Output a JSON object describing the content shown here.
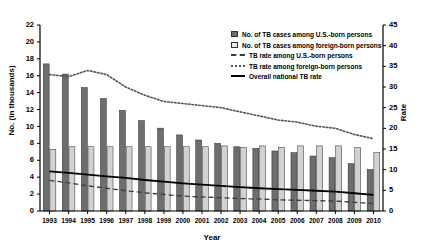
{
  "chart_data": {
    "type": "bar",
    "title": "",
    "xlabel": "Year",
    "ylabel": "No. (in thousands)",
    "ylabel_secondary": "Rate",
    "ylim": [
      0,
      22
    ],
    "ylim_secondary": [
      0,
      45
    ],
    "ytick_values": [
      0,
      2,
      4,
      6,
      8,
      10,
      12,
      14,
      16,
      18,
      20,
      22
    ],
    "ytick_values_secondary": [
      0,
      5,
      10,
      15,
      20,
      25,
      30,
      35,
      40,
      45
    ],
    "grid": false,
    "legend_position": "top-right",
    "categories": [
      "1993",
      "1994",
      "1995",
      "1996",
      "1997",
      "1998",
      "1999",
      "2000",
      "2001",
      "2002",
      "2003",
      "2004",
      "2005",
      "2006",
      "2007",
      "2008",
      "2009",
      "2010"
    ],
    "series": [
      {
        "name": "No. of TB cases among U.S.-born persons",
        "type": "bar",
        "axis": "left",
        "color": "#6e6e6e",
        "values": [
          17.4,
          16.2,
          14.6,
          13.3,
          11.9,
          10.7,
          9.8,
          9.0,
          8.4,
          8.0,
          7.6,
          7.4,
          7.1,
          6.9,
          6.5,
          6.3,
          5.6,
          4.9
        ]
      },
      {
        "name": "No. of TB cases among foreign-born persons",
        "type": "bar",
        "axis": "left",
        "color": "#d2d2d2",
        "values": [
          7.3,
          7.6,
          7.6,
          7.6,
          7.6,
          7.6,
          7.6,
          7.6,
          7.6,
          7.7,
          7.5,
          7.7,
          7.5,
          7.7,
          7.7,
          7.7,
          7.5,
          6.9
        ]
      },
      {
        "name": "TB rate among U.S.-born persons",
        "type": "line",
        "axis": "right",
        "style": "dashed",
        "color": "#3c3c3c",
        "values": [
          7.4,
          6.8,
          6.1,
          5.5,
          4.9,
          4.4,
          4.0,
          3.6,
          3.4,
          3.2,
          3.0,
          2.9,
          2.7,
          2.6,
          2.5,
          2.4,
          2.1,
          1.8
        ]
      },
      {
        "name": "TB rate among foreign-born persons",
        "type": "line",
        "axis": "right",
        "style": "dotted",
        "color": "#555555",
        "values": [
          33.0,
          32.5,
          34.0,
          33.0,
          30.0,
          28.0,
          26.5,
          26.0,
          25.5,
          25.0,
          24.0,
          23.0,
          22.0,
          21.5,
          20.5,
          20.0,
          18.5,
          17.5
        ]
      },
      {
        "name": "Overall national TB rate",
        "type": "line",
        "axis": "right",
        "style": "solid",
        "color": "#000000",
        "values": [
          9.6,
          9.2,
          8.8,
          8.4,
          8.0,
          7.5,
          7.1,
          6.7,
          6.4,
          6.1,
          5.8,
          5.5,
          5.3,
          5.1,
          4.9,
          4.7,
          4.3,
          3.9
        ]
      }
    ],
    "legend_entries": [
      {
        "label": "No. of TB cases among U.S.-born persons",
        "marker": "swatch-dark"
      },
      {
        "label": "No. of TB cases among foreign-born persons",
        "marker": "swatch-light"
      },
      {
        "label": "TB rate among U.S.-born persons",
        "marker": "line-dashed"
      },
      {
        "label": "TB rate among foreign-born persons",
        "marker": "line-dotted"
      },
      {
        "label": "Overall national TB rate",
        "marker": "line-solid"
      }
    ]
  }
}
